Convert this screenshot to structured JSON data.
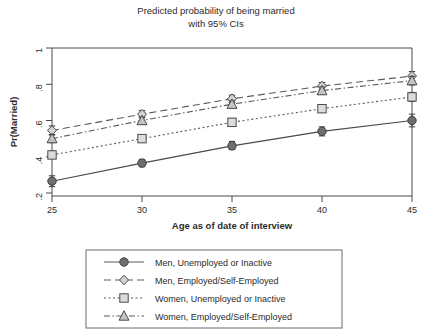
{
  "chart_data": {
    "type": "line",
    "title": "Predicted probability of being married",
    "subtitle": "with 95% CIs",
    "xlabel": "Age as of date of interview",
    "ylabel": "Pr(Married)",
    "x": [
      25,
      30,
      35,
      40,
      45
    ],
    "xtick_labels": [
      "25",
      "30",
      "35",
      "40",
      "45"
    ],
    "ytick_labels": [
      ".2",
      ".4",
      ".6",
      ".8",
      "1"
    ],
    "ytick_values": [
      0.2,
      0.4,
      0.6,
      0.8,
      1
    ],
    "xlim": [
      25,
      45
    ],
    "ylim": [
      0.18,
      1.0
    ],
    "grid": false,
    "legend_position": "below-plot",
    "error_bars": "95% CIs",
    "series": [
      {
        "name": "Men, Unemployed or Inactive",
        "marker": "filled-circle",
        "linestyle": "solid",
        "color": "#6e6e6e",
        "values": [
          0.265,
          0.365,
          0.46,
          0.54,
          0.6
        ],
        "ci_lower": [
          0.235,
          0.345,
          0.44,
          0.515,
          0.565
        ],
        "ci_upper": [
          0.295,
          0.385,
          0.485,
          0.565,
          0.635
        ]
      },
      {
        "name": "Men, Employed/Self-Employed",
        "marker": "open-diamond",
        "linestyle": "dashed",
        "color": "#9a9a9a",
        "values": [
          0.545,
          0.635,
          0.72,
          0.79,
          0.845
        ],
        "ci_lower": [
          0.52,
          0.615,
          0.7,
          0.77,
          0.82
        ],
        "ci_upper": [
          0.57,
          0.655,
          0.74,
          0.81,
          0.87
        ]
      },
      {
        "name": "Women, Unemployed or Inactive",
        "marker": "open-square",
        "linestyle": "dotted",
        "color": "#a8a8a8",
        "values": [
          0.41,
          0.5,
          0.59,
          0.665,
          0.73
        ],
        "ci_lower": [
          0.39,
          0.483,
          0.572,
          0.645,
          0.705
        ],
        "ci_upper": [
          0.43,
          0.517,
          0.608,
          0.685,
          0.755
        ]
      },
      {
        "name": "Women, Employed/Self-Employed",
        "marker": "open-triangle",
        "linestyle": "dashdot",
        "color": "#8f8f8f",
        "values": [
          0.5,
          0.6,
          0.69,
          0.765,
          0.82
        ],
        "ci_lower": [
          0.478,
          0.582,
          0.672,
          0.745,
          0.796
        ],
        "ci_upper": [
          0.522,
          0.618,
          0.708,
          0.785,
          0.844
        ]
      }
    ]
  },
  "chart": {
    "title_line1": "Predicted probability of being married",
    "title_line2": "with 95% CIs",
    "ylabel": "Pr(Married)",
    "xlabel": "Age as of date of interview",
    "xticks": [
      "25",
      "30",
      "35",
      "40",
      "45"
    ],
    "yticks": [
      "1",
      ".8",
      ".6",
      ".4",
      ".2"
    ]
  },
  "legend": {
    "items": [
      {
        "label": "Men, Unemployed or Inactive"
      },
      {
        "label": "Men, Employed/Self-Employed"
      },
      {
        "label": "Women, Unemployed or Inactive"
      },
      {
        "label": "Women, Employed/Self-Employed"
      }
    ]
  }
}
